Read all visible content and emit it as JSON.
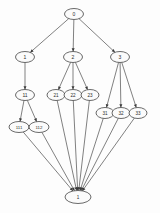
{
  "diagram": {
    "type": "directed-graph",
    "background_color": "#fdfdfd",
    "node_fill_color": "#fbfbfb",
    "node_stroke_color": "#3a3a3a",
    "edge_color": "#4a4a4a",
    "text_color": "#2b2b2b",
    "nodes": [
      {
        "id": "n0",
        "label": "0",
        "x": 74,
        "y": 14,
        "rx": 9.5,
        "ry": 5.5,
        "font_size": 5.0
      },
      {
        "id": "n1",
        "label": "1",
        "x": 25,
        "y": 57,
        "rx": 9.5,
        "ry": 5.5,
        "font_size": 5.0
      },
      {
        "id": "n2",
        "label": "2",
        "x": 73,
        "y": 57,
        "rx": 9.5,
        "ry": 5.5,
        "font_size": 5.0
      },
      {
        "id": "n3",
        "label": "3",
        "x": 120,
        "y": 57,
        "rx": 9.5,
        "ry": 5.5,
        "font_size": 5.0
      },
      {
        "id": "n11",
        "label": "11",
        "x": 25,
        "y": 95,
        "rx": 9.5,
        "ry": 5.5,
        "font_size": 5.0
      },
      {
        "id": "n21",
        "label": "21",
        "x": 56,
        "y": 95,
        "rx": 9.0,
        "ry": 5.5,
        "font_size": 4.6
      },
      {
        "id": "n22",
        "label": "22",
        "x": 73,
        "y": 95,
        "rx": 9.0,
        "ry": 5.5,
        "font_size": 4.6
      },
      {
        "id": "n23",
        "label": "23",
        "x": 90,
        "y": 95,
        "rx": 9.0,
        "ry": 5.5,
        "font_size": 4.6
      },
      {
        "id": "n31",
        "label": "31",
        "x": 105,
        "y": 113,
        "rx": 9.0,
        "ry": 5.5,
        "font_size": 4.6
      },
      {
        "id": "n32",
        "label": "32",
        "x": 121,
        "y": 113,
        "rx": 9.0,
        "ry": 5.5,
        "font_size": 4.6
      },
      {
        "id": "n33",
        "label": "33",
        "x": 138,
        "y": 113,
        "rx": 9.0,
        "ry": 5.5,
        "font_size": 4.6
      },
      {
        "id": "n111",
        "label": "111",
        "x": 19,
        "y": 127,
        "rx": 10.0,
        "ry": 5.5,
        "font_size": 4.4
      },
      {
        "id": "n112",
        "label": "112",
        "x": 39,
        "y": 127,
        "rx": 10.0,
        "ry": 5.5,
        "font_size": 4.4
      },
      {
        "id": "nT",
        "label": "1",
        "x": 78,
        "y": 197,
        "rx": 13.0,
        "ry": 6.5,
        "font_size": 4.6
      }
    ],
    "edges": [
      {
        "from": "n0",
        "to": "n1"
      },
      {
        "from": "n0",
        "to": "n2"
      },
      {
        "from": "n0",
        "to": "n3"
      },
      {
        "from": "n1",
        "to": "n11"
      },
      {
        "from": "n2",
        "to": "n21"
      },
      {
        "from": "n2",
        "to": "n22"
      },
      {
        "from": "n2",
        "to": "n23"
      },
      {
        "from": "n3",
        "to": "n31"
      },
      {
        "from": "n3",
        "to": "n32"
      },
      {
        "from": "n3",
        "to": "n33"
      },
      {
        "from": "n11",
        "to": "n111"
      },
      {
        "from": "n11",
        "to": "n112"
      },
      {
        "from": "n111",
        "to": "nT"
      },
      {
        "from": "n112",
        "to": "nT"
      },
      {
        "from": "n21",
        "to": "nT"
      },
      {
        "from": "n22",
        "to": "nT"
      },
      {
        "from": "n23",
        "to": "nT"
      },
      {
        "from": "n31",
        "to": "nT"
      },
      {
        "from": "n32",
        "to": "nT"
      },
      {
        "from": "n33",
        "to": "nT"
      }
    ]
  }
}
